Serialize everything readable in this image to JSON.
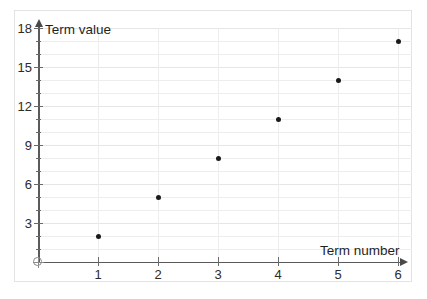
{
  "chart_data": {
    "type": "scatter",
    "title": "",
    "xlabel": "Term number",
    "ylabel": "Term value",
    "x": [
      1,
      2,
      3,
      4,
      5,
      6
    ],
    "values": [
      2,
      5,
      8,
      11,
      14,
      17
    ],
    "points": [
      {
        "x": 1,
        "y": 2
      },
      {
        "x": 2,
        "y": 5
      },
      {
        "x": 3,
        "y": 8
      },
      {
        "x": 4,
        "y": 11
      },
      {
        "x": 5,
        "y": 14
      },
      {
        "x": 6,
        "y": 17
      }
    ],
    "xlim": [
      0,
      6
    ],
    "ylim": [
      0,
      18
    ],
    "x_tick_labels": [
      "1",
      "2",
      "3",
      "4",
      "5",
      "6"
    ],
    "y_tick_labels": [
      "3",
      "6",
      "9",
      "12",
      "15",
      "18"
    ],
    "y_tick_values": [
      3,
      6,
      9,
      12,
      15,
      18
    ],
    "y_minor_step": 1,
    "grid": true,
    "legend": "none",
    "origin_marker": "crossed-circle",
    "colors": {
      "point": "#1a1a1a",
      "axis": "#5a5a5a",
      "grid": "#ededed",
      "grid_major": "#e6e6e6",
      "frame": "#e3e3e3",
      "text": "#1f1f1f",
      "background": "#ffffff"
    }
  },
  "axes": {
    "y_title": "Term value",
    "x_title": "Term number"
  }
}
